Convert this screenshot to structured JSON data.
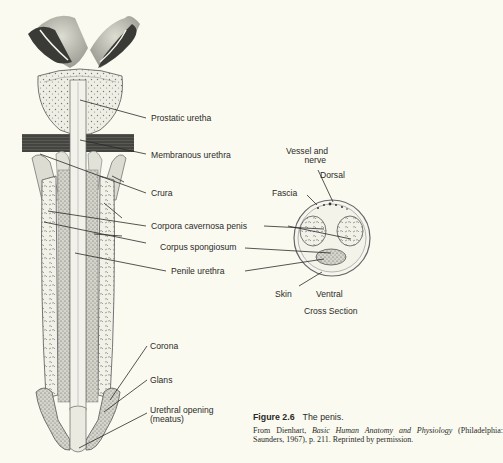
{
  "figure": {
    "number": "Figure 2.6",
    "title": "The penis.",
    "credit": {
      "prefix": "From Dienhart, ",
      "book": "Basic Human Anatomy and Physiology",
      "suffix": " (Philadelphia: Saunders, 1967), p. 211. Reprinted by permission."
    }
  },
  "longitudinal_labels": [
    {
      "id": "prostatic-urethra",
      "text": "Prostatic uretha"
    },
    {
      "id": "membranous-urethra",
      "text": "Membranous urethra"
    },
    {
      "id": "crura",
      "text": "Crura"
    },
    {
      "id": "corpora-cavernosa-penis",
      "text": "Corpora cavernosa penis"
    },
    {
      "id": "corpus-spongiosum",
      "text": "Corpus spongiosum"
    },
    {
      "id": "penile-urethra",
      "text": "Penile urethra"
    },
    {
      "id": "corona",
      "text": "Corona"
    },
    {
      "id": "glans",
      "text": "Glans"
    },
    {
      "id": "urethral-opening",
      "text": "Urethral opening\n(meatus)"
    }
  ],
  "cross_section": {
    "title": "Cross Section",
    "labels": [
      {
        "id": "vessel-and-nerve",
        "text": "Vessel and\nnerve"
      },
      {
        "id": "dorsal",
        "text": "Dorsal"
      },
      {
        "id": "fascia",
        "text": "Fascia"
      },
      {
        "id": "skin",
        "text": "Skin"
      },
      {
        "id": "ventral",
        "text": "Ventral"
      }
    ]
  },
  "colors": {
    "paper": "#fbfaf1",
    "ink": "#2a2a28",
    "tissue": "#e6e6dc",
    "dark_tissue": "#3e3e3a"
  }
}
